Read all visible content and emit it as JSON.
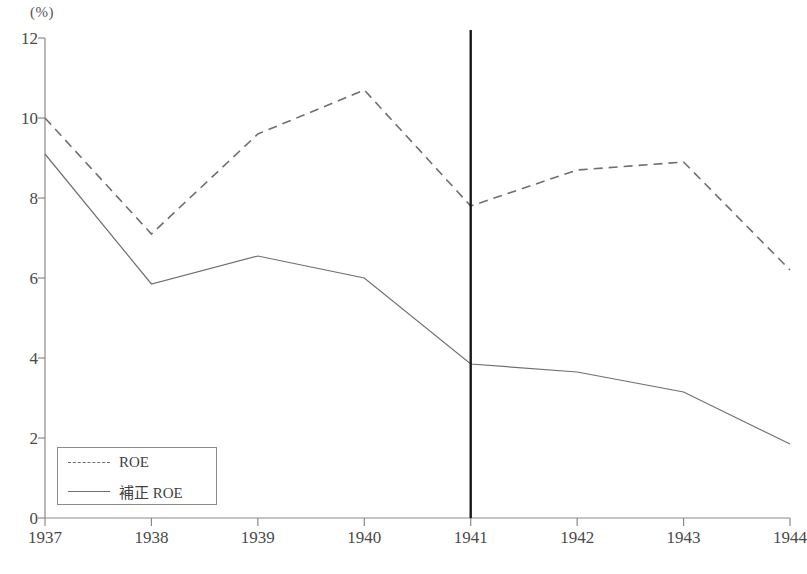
{
  "chart_data": {
    "type": "line",
    "title": "",
    "xlabel": "",
    "ylabel": "(%)",
    "unit_label": "(%)",
    "categories": [
      "1937",
      "1938",
      "1939",
      "1940",
      "1941",
      "1942",
      "1943",
      "1944"
    ],
    "x": [
      1937,
      1938,
      1939,
      1940,
      1941,
      1942,
      1943,
      1944
    ],
    "ylim": [
      0,
      12
    ],
    "xlim": [
      1937,
      1944
    ],
    "y_ticks": [
      0,
      2,
      4,
      6,
      8,
      10,
      12
    ],
    "y_tick_labels": [
      "0",
      "2",
      "4",
      "6",
      "8",
      "10",
      "12"
    ],
    "grid": false,
    "legend_position": "bottom-left",
    "series": [
      {
        "name": "ROE",
        "style": "dashed",
        "color": "#6f6f6f",
        "values": [
          10.0,
          7.1,
          9.6,
          10.7,
          7.8,
          8.7,
          8.9,
          6.2
        ]
      },
      {
        "name": "補正 ROE",
        "style": "solid",
        "color": "#6f6f6f",
        "values": [
          9.1,
          5.85,
          6.55,
          6.0,
          3.85,
          3.65,
          3.15,
          1.85
        ]
      }
    ],
    "annotations": [
      {
        "type": "vertical-line",
        "name": "year-1941-marker",
        "x": 1941,
        "color": "#1a1a1a",
        "label": ""
      }
    ]
  },
  "legend": {
    "items": [
      {
        "label": "ROE",
        "style": "dashed"
      },
      {
        "label": "補正 ROE",
        "style": "solid"
      }
    ]
  },
  "caption": {
    "text": ""
  },
  "colors": {
    "axis": "#8a8a8a",
    "line": "#6f6f6f",
    "marker": "#1a1a1a",
    "text": "#4a4a4a"
  }
}
